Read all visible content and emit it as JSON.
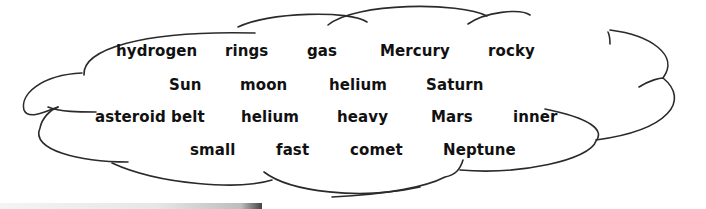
{
  "word_bank": {
    "rows": [
      [
        "hydrogen",
        "rings",
        "gas",
        "Mercury",
        "rocky"
      ],
      [
        "Sun",
        "moon",
        "helium",
        "Saturn"
      ],
      [
        "asteroid belt",
        "helium",
        "heavy",
        "Mars",
        "inner"
      ],
      [
        "small",
        "fast",
        "comet",
        "Neptune"
      ]
    ]
  },
  "colors": {
    "text": "#111111",
    "outline": "#2a2a2a",
    "background": "#ffffff"
  }
}
